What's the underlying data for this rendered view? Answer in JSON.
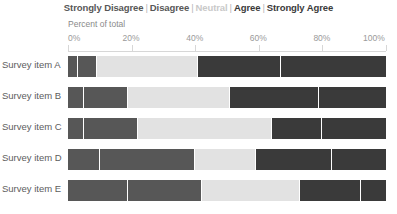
{
  "legend": {
    "items": [
      {
        "label": "Strongly Disagree",
        "color": "#575757"
      },
      {
        "label": "Disagree",
        "color": "#575757"
      },
      {
        "label": "Neutral",
        "color": "#c9c9c9"
      },
      {
        "label": "Agree",
        "color": "#3a3a3a"
      },
      {
        "label": "Strongly Agree",
        "color": "#3a3a3a"
      }
    ],
    "separator": "|"
  },
  "axis": {
    "title": "Percent of total",
    "ticks": [
      {
        "label": "0%",
        "value": 0
      },
      {
        "label": "20%",
        "value": 20
      },
      {
        "label": "40%",
        "value": 40
      },
      {
        "label": "60%",
        "value": 60
      },
      {
        "label": "80%",
        "value": 80
      },
      {
        "label": "100%",
        "value": 100
      }
    ]
  },
  "chart_data": {
    "type": "bar",
    "title": "",
    "subtitle": "",
    "xlabel": "Percent of total",
    "ylabel": "",
    "xlim": [
      0,
      100
    ],
    "grid": false,
    "legend_position": "top-center",
    "orientation": "horizontal",
    "stacked": true,
    "categories": [
      "Survey item A",
      "Survey item B",
      "Survey item C",
      "Survey item D",
      "Survey item E"
    ],
    "series": [
      {
        "name": "Strongly Disagree",
        "color": "#575757",
        "values": [
          3,
          5,
          5,
          10,
          19
        ]
      },
      {
        "name": "Disagree",
        "color": "#575757",
        "values": [
          6,
          14,
          17,
          30,
          23
        ]
      },
      {
        "name": "Neutral",
        "color": "#e2e2e2",
        "values": [
          32,
          32,
          42,
          19,
          31
        ]
      },
      {
        "name": "Agree",
        "color": "#3a3a3a",
        "values": [
          26,
          28,
          16,
          24,
          19
        ]
      },
      {
        "name": "Strongly Agree",
        "color": "#3a3a3a",
        "values": [
          33,
          21,
          20,
          17,
          8
        ]
      }
    ],
    "tick_labels": [
      "0%",
      "20%",
      "40%",
      "60%",
      "80%",
      "100%"
    ]
  }
}
